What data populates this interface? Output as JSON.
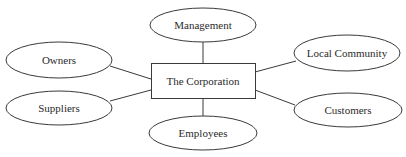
{
  "diagram": {
    "center": {
      "label": "The Corporation",
      "x": 151,
      "y": 63,
      "w": 104,
      "h": 35
    },
    "stakeholders": [
      {
        "id": "management",
        "label": "Management",
        "cx": 203,
        "cy": 25,
        "rx": 53,
        "ry": 17
      },
      {
        "id": "owners",
        "label": "Owners",
        "cx": 59,
        "cy": 60,
        "rx": 53,
        "ry": 18
      },
      {
        "id": "local-community",
        "label": "Local Community",
        "cx": 347,
        "cy": 53,
        "rx": 53,
        "ry": 18
      },
      {
        "id": "suppliers",
        "label": "Suppliers",
        "cx": 59,
        "cy": 108,
        "rx": 53,
        "ry": 17
      },
      {
        "id": "customers",
        "label": "Customers",
        "cx": 348,
        "cy": 110,
        "rx": 54,
        "ry": 17
      },
      {
        "id": "employees",
        "label": "Employees",
        "cx": 203,
        "cy": 133,
        "rx": 54,
        "ry": 17
      }
    ],
    "edges": [
      {
        "from": "center",
        "to": "management",
        "x1": 203,
        "y1": 63,
        "x2": 203,
        "y2": 42
      },
      {
        "from": "center",
        "to": "owners",
        "x1": 151,
        "y1": 79,
        "x2": 110,
        "y2": 66
      },
      {
        "from": "center",
        "to": "local-community",
        "x1": 255,
        "y1": 72,
        "x2": 296,
        "y2": 61
      },
      {
        "from": "center",
        "to": "suppliers",
        "x1": 151,
        "y1": 90,
        "x2": 110,
        "y2": 101
      },
      {
        "from": "center",
        "to": "customers",
        "x1": 255,
        "y1": 90,
        "x2": 295,
        "y2": 105
      },
      {
        "from": "center",
        "to": "employees",
        "x1": 203,
        "y1": 98,
        "x2": 203,
        "y2": 116
      }
    ],
    "colors": {
      "stroke": "#3a3a3a",
      "text": "#2a2a2a",
      "fill": "#ffffff",
      "background": "#ffffff"
    }
  }
}
